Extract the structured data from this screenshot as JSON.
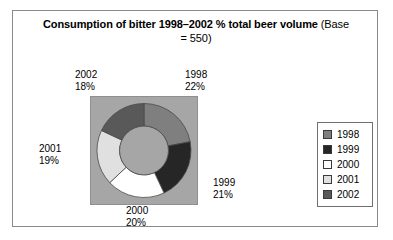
{
  "figure": {
    "title_bold": "Consumption of bitter 1998–2002 % total beer volume",
    "title_note": " (Base = 550)"
  },
  "chart_data": {
    "type": "pie",
    "variant": "doughnut",
    "title": "Consumption of bitter 1998–2002 % total beer volume (Base = 550)",
    "base": 550,
    "unit": "%",
    "start_angle_deg": 0,
    "direction": "clockwise",
    "inner_radius_ratio": 0.52,
    "legend_position": "right",
    "categories": [
      "1998",
      "1999",
      "2000",
      "2001",
      "2002"
    ],
    "values": [
      22,
      21,
      20,
      19,
      18
    ],
    "slices": [
      {
        "label": "1998",
        "value": 22,
        "value_text": "22%",
        "color": "#7f7f7f"
      },
      {
        "label": "1999",
        "value": 21,
        "value_text": "21%",
        "color": "#262626"
      },
      {
        "label": "2000",
        "value": 20,
        "value_text": "20%",
        "color": "#ffffff"
      },
      {
        "label": "2001",
        "value": 19,
        "value_text": "19%",
        "color": "#e0e0e0"
      },
      {
        "label": "2002",
        "value": 18,
        "value_text": "18%",
        "color": "#595959"
      }
    ],
    "plot_background": "#a6a6a6",
    "hole_color": "#a6a6a6"
  },
  "labels": {
    "l1998": {
      "year": "1998",
      "pct": "22%"
    },
    "l1999": {
      "year": "1999",
      "pct": "21%"
    },
    "l2000": {
      "year": "2000",
      "pct": "20%"
    },
    "l2001": {
      "year": "2001",
      "pct": "19%"
    },
    "l2002": {
      "year": "2002",
      "pct": "18%"
    }
  },
  "legend": {
    "items": [
      {
        "label": "1998",
        "color": "#7f7f7f"
      },
      {
        "label": "1999",
        "color": "#262626"
      },
      {
        "label": "2000",
        "color": "#ffffff"
      },
      {
        "label": "2001",
        "color": "#e0e0e0"
      },
      {
        "label": "2002",
        "color": "#595959"
      }
    ]
  }
}
